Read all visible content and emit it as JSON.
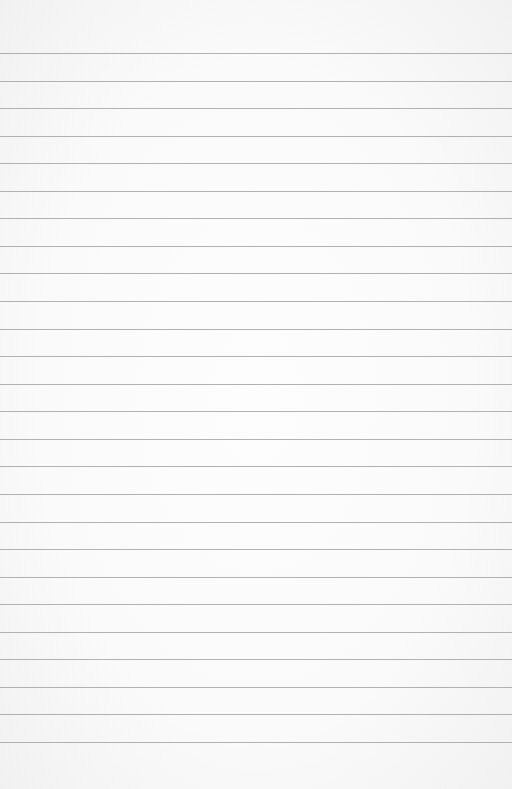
{
  "paper": {
    "type": "lined-paper",
    "background_color": "#fafafa",
    "line_color": "#9a9a9a",
    "line_count": 26,
    "first_line_y": 53,
    "line_spacing": 27.56
  }
}
